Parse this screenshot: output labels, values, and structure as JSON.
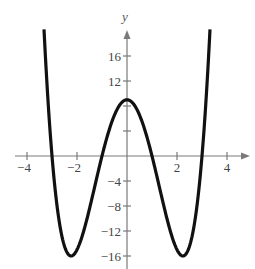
{
  "chart_data": {
    "type": "line",
    "title": "",
    "xlabel": "",
    "ylabel": "y",
    "function": "y = x^4 - 10x^2 + 9",
    "xlim": [
      -4.5,
      4.9
    ],
    "ylim": [
      -18,
      20
    ],
    "grid": false,
    "legend": null,
    "x_ticks": [
      -4,
      -2,
      2,
      4
    ],
    "x_tick_labels": [
      "−4",
      "−2",
      "2",
      "4"
    ],
    "y_ticks": [
      16,
      12,
      8,
      4,
      -4,
      -8,
      -12,
      -16
    ],
    "y_tick_labels": [
      "16",
      "12",
      "",
      "",
      "−4",
      "−8",
      "−12",
      "−16"
    ],
    "series": [
      {
        "name": "f(x)",
        "x": [
          -3.32,
          -3.0,
          -2.5,
          -2.236,
          -2.0,
          -1.5,
          -1.0,
          -0.5,
          0.0,
          0.5,
          1.0,
          1.5,
          2.0,
          2.236,
          2.5,
          3.0,
          3.32
        ],
        "values": [
          20.3,
          0.0,
          -14.44,
          -16.0,
          -15.0,
          -8.44,
          0.0,
          6.56,
          9.0,
          6.56,
          0.0,
          -8.44,
          -15.0,
          -16.0,
          -14.44,
          0.0,
          20.3
        ]
      }
    ],
    "key_points": {
      "local_max": [
        0,
        9
      ],
      "minima": [
        [
          -2.236,
          -16
        ],
        [
          2.236,
          -16
        ]
      ],
      "x_intercepts": [
        -3,
        -1,
        1,
        3
      ]
    }
  },
  "layout": {
    "origin_px": [
      127,
      156
    ],
    "x_unit_px": 25,
    "y_unit_px": 6.25,
    "x_axis_px": [
      15,
      250
    ],
    "y_axis_px": [
      269,
      30
    ],
    "curve_x_range": [
      -3.32,
      3.32
    ]
  },
  "labels": {
    "y_axis": "y"
  }
}
